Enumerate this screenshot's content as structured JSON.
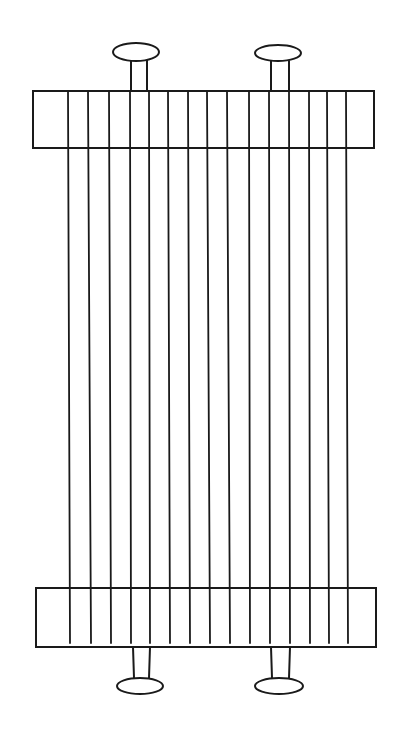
{
  "diagram": {
    "colors": {
      "background": "#ffffff",
      "line": "#1a1a1a"
    },
    "top_beam": {
      "x": 33,
      "y": 91,
      "width": 341,
      "height": 57
    },
    "bottom_beam": {
      "x": 36,
      "y": 588,
      "width": 340,
      "height": 59
    },
    "warp_thread_count": 15,
    "warp_threads_top_x": [
      68,
      88,
      109,
      130,
      149,
      168,
      188,
      207,
      227,
      249,
      269,
      289,
      309,
      327,
      346
    ],
    "warp_threads_bottom_x": [
      70,
      91,
      111,
      131,
      150,
      170,
      190,
      210,
      230,
      250,
      270,
      290,
      310,
      329,
      348
    ],
    "knobs": [
      {
        "name": "top-left-knob",
        "cx": 136,
        "cy": 52,
        "rx": 23,
        "ry": 9,
        "stem_x1": 131,
        "stem_x2": 147,
        "stem_y1": 60,
        "stem_y2": 91
      },
      {
        "name": "top-right-knob",
        "cx": 278,
        "cy": 53,
        "rx": 23,
        "ry": 8,
        "stem_x1": 271,
        "stem_x2": 289,
        "stem_y1": 61,
        "stem_y2": 91
      },
      {
        "name": "bottom-left-knob",
        "cx": 140,
        "cy": 686,
        "rx": 23,
        "ry": 8,
        "stem_x1": 133,
        "stem_x2": 150,
        "stem_y1": 647,
        "stem_y2": 678
      },
      {
        "name": "bottom-right-knob",
        "cx": 279,
        "cy": 686,
        "rx": 24,
        "ry": 8,
        "stem_x1": 271,
        "stem_x2": 290,
        "stem_y1": 647,
        "stem_y2": 678
      }
    ]
  }
}
